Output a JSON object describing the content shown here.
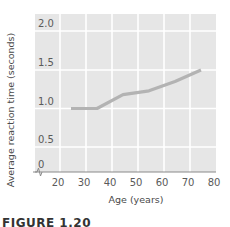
{
  "chart_data": {
    "type": "line",
    "title": "",
    "xlabel": "Age (years)",
    "ylabel": "Average reaction time (seconds)",
    "x_ticks": [
      "20",
      "30",
      "40",
      "50",
      "60",
      "70",
      "80"
    ],
    "y_ticks": [
      "0",
      "0.5",
      "1.0",
      "1.5",
      "2.0"
    ],
    "xlim": [
      15,
      85
    ],
    "ylim": [
      0,
      2.2
    ],
    "grid": true,
    "legend": null,
    "axis_break": "y-axis break near origin",
    "series": [
      {
        "name": "Average reaction time",
        "color": "#b3b3b3",
        "x": [
          25,
          35,
          45,
          55,
          65,
          75
        ],
        "values": [
          1.0,
          1.0,
          1.18,
          1.23,
          1.35,
          1.5
        ]
      }
    ]
  },
  "caption": "FIGURE 1.20",
  "colors": {
    "plot_bg": "#e6e6e6",
    "grid": "#ffffff",
    "line": "#b3b3b3",
    "axis": "#8a8a8a"
  }
}
